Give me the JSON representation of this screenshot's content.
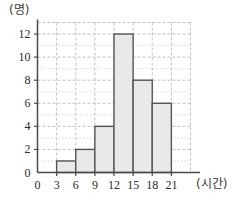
{
  "chart_data": {
    "type": "bar",
    "title": "",
    "subtitle": "",
    "xlabel": "(시간)",
    "ylabel": "(명)",
    "categories": [
      "0~3",
      "3~6",
      "6~9",
      "9~12",
      "12~15",
      "15~18",
      "18~21"
    ],
    "bin_edges": [
      0,
      3,
      6,
      9,
      12,
      15,
      18,
      21
    ],
    "values": [
      0,
      1,
      2,
      4,
      12,
      8,
      6
    ],
    "xlim": [
      0,
      24
    ],
    "ylim": [
      0,
      13
    ],
    "xticks": [
      0,
      3,
      6,
      9,
      12,
      15,
      18,
      21
    ],
    "yticks": [
      0,
      2,
      4,
      6,
      8,
      10,
      12
    ],
    "xtick_labels": [
      "0",
      "3",
      "6",
      "9",
      "12",
      "15",
      "18",
      "21"
    ],
    "ytick_labels": [
      "0",
      "2",
      "4",
      "6",
      "8",
      "10",
      "12"
    ],
    "grid": true,
    "grid_style": "dashed",
    "legend": false,
    "legend_position": "none",
    "bar_fill_color": "#e9e9e9",
    "bar_edge_color": "#555555",
    "grid_color": "#b8b8b8",
    "axis_color": "#4a4a4a",
    "background_color": "#ffffff"
  }
}
